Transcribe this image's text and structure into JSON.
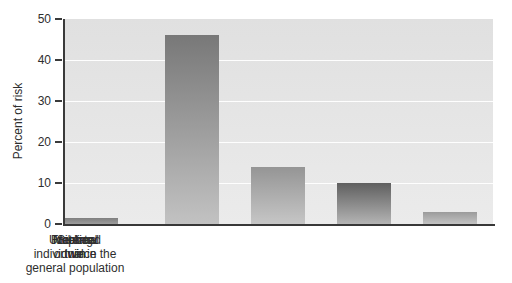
{
  "chart_data": {
    "type": "bar",
    "title": "",
    "xlabel": "",
    "ylabel": "Percent of risk",
    "ylim": [
      0,
      50
    ],
    "yticks": [
      0,
      10,
      20,
      30,
      40,
      50
    ],
    "grid": "horizontal-white-gridlines",
    "legend": "none",
    "categories": [
      "Identical\ntwin",
      "Fraternal\ntwin",
      "Sibling",
      "Nephew\nor niece",
      "Unrelated\nindividual in the\ngeneral population"
    ],
    "values": [
      46,
      14,
      10,
      3,
      1.5
    ],
    "bar_colors": [
      [
        "#787878",
        "#c2c2c2"
      ],
      [
        "#959595",
        "#c6c6c6"
      ],
      [
        "#5f5f5f",
        "#b4b4b4"
      ],
      [
        "#9b9b9b",
        "#c3c3c3"
      ],
      [
        "#7f7f7f",
        "#9d9d9d"
      ]
    ]
  },
  "colors": {
    "page_background": "#ffffff",
    "plot_background_top": "#e0e0e0",
    "plot_background_bottom": "#ebebeb",
    "gridline": "#ffffff",
    "axis": "#3a3a3a",
    "text": "#2e2e2e"
  }
}
